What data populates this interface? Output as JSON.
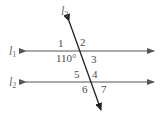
{
  "diagram": {
    "type": "parallel lines cut by a transversal",
    "lines": [
      {
        "id": "l1",
        "label": "l",
        "subscript": "1",
        "kind": "horizontal"
      },
      {
        "id": "l2",
        "label": "l",
        "subscript": "2",
        "kind": "horizontal"
      },
      {
        "id": "l3",
        "label": "l",
        "subscript": "3",
        "kind": "transversal"
      }
    ],
    "angles": {
      "a1": "1",
      "a2": "2",
      "given": "110°",
      "a3": "3",
      "a5": "5",
      "a4": "4",
      "a6": "6",
      "a7": "7"
    },
    "colors": {
      "line": "#555555",
      "transversal": "#222222",
      "text": "#4a4a4a"
    }
  }
}
